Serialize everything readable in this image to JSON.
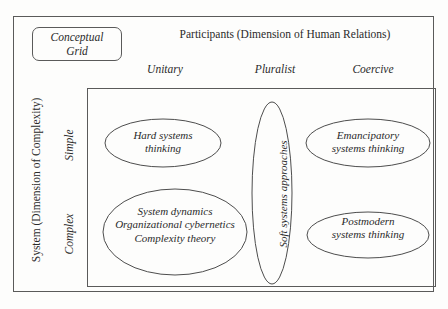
{
  "figure": {
    "legend": {
      "line1": "Conceptual",
      "line2": "Grid"
    },
    "top_axis_title": "Participants (Dimension of Human Relations)",
    "left_axis_title": "System (Dimension of Complexity)",
    "columns": [
      {
        "label": "Unitary"
      },
      {
        "label": "Pluralist"
      },
      {
        "label": "Coercive"
      }
    ],
    "rows": [
      {
        "label": "Simple"
      },
      {
        "label": "Complex"
      }
    ],
    "cells": [
      {
        "id": "simple-unitary",
        "lines": [
          "Hard systems",
          "thinking"
        ]
      },
      {
        "id": "simple-coercive",
        "lines": [
          "Emancipatory",
          "systems thinking"
        ]
      },
      {
        "id": "complex-unitary",
        "lines": [
          "System dynamics",
          "Organizational cybernetics",
          "Complexity theory"
        ]
      },
      {
        "id": "complex-coercive",
        "lines": [
          "Postmodern",
          "systems thinking"
        ]
      },
      {
        "id": "pluralist-span",
        "lines": [
          "Soft systems approaches"
        ]
      }
    ],
    "colors": {
      "background": "#fdfdfc",
      "stroke": "#5a5a5a",
      "ellipse_stroke": "#4d4d4d",
      "text": "#2a2a2a"
    }
  }
}
